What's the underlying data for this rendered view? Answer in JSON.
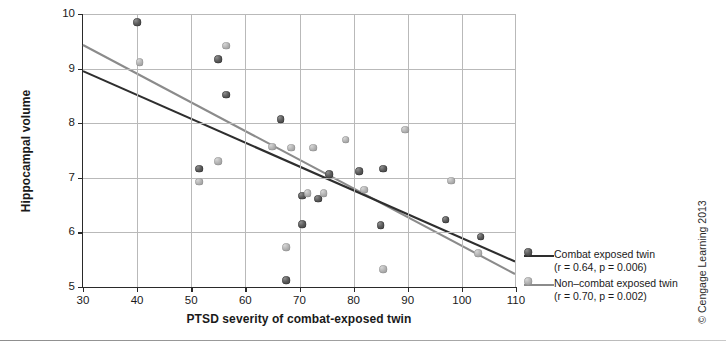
{
  "figure": {
    "copyright": "© Cengage Learning 2013"
  },
  "chart_data": {
    "type": "scatter",
    "title": "",
    "xlabel": "PTSD severity of combat-exposed twin",
    "ylabel": "Hippocampal volume",
    "xlim": [
      30,
      110
    ],
    "ylim": [
      5,
      10
    ],
    "xticks": [
      30,
      40,
      50,
      60,
      70,
      80,
      90,
      100,
      110
    ],
    "yticks": [
      5,
      6,
      7,
      8,
      9,
      10
    ],
    "grid": true,
    "legend_position": "right-outside",
    "series": [
      {
        "name": "Combat exposed twin",
        "stat_label": "(r = 0.64, p = 0.006)",
        "r": 0.64,
        "p": 0.006,
        "color": "#4a4a4a",
        "line_color": "#2e2e2e",
        "marker": "dark",
        "fit_line": {
          "x0": 30,
          "y0": 8.95,
          "x1": 110,
          "y1": 5.45
        },
        "points": [
          {
            "x": 40,
            "y": 9.85
          },
          {
            "x": 55,
            "y": 9.17
          },
          {
            "x": 56.5,
            "y": 8.52
          },
          {
            "x": 51.5,
            "y": 7.17
          },
          {
            "x": 66.5,
            "y": 8.07
          },
          {
            "x": 70.5,
            "y": 6.67
          },
          {
            "x": 70.5,
            "y": 6.15
          },
          {
            "x": 73.5,
            "y": 6.62
          },
          {
            "x": 75.5,
            "y": 7.07
          },
          {
            "x": 67.5,
            "y": 5.12
          },
          {
            "x": 81,
            "y": 7.12
          },
          {
            "x": 85.5,
            "y": 7.17
          },
          {
            "x": 85,
            "y": 6.13
          },
          {
            "x": 97,
            "y": 6.23
          },
          {
            "x": 103.5,
            "y": 5.92
          }
        ]
      },
      {
        "name": "Non–combat exposed twin",
        "stat_label": "(r = 0.70, p = 0.002)",
        "r": 0.7,
        "p": 0.002,
        "color": "#a8a8a8",
        "line_color": "#8b8b8b",
        "marker": "light",
        "fit_line": {
          "x0": 30,
          "y0": 9.43,
          "x1": 110,
          "y1": 5.22
        },
        "points": [
          {
            "x": 40.5,
            "y": 9.12
          },
          {
            "x": 56.5,
            "y": 9.42
          },
          {
            "x": 51.5,
            "y": 6.93
          },
          {
            "x": 55,
            "y": 7.3
          },
          {
            "x": 65,
            "y": 7.57
          },
          {
            "x": 68.5,
            "y": 7.55
          },
          {
            "x": 71.5,
            "y": 6.72
          },
          {
            "x": 74.5,
            "y": 6.72
          },
          {
            "x": 72.5,
            "y": 7.55
          },
          {
            "x": 67.5,
            "y": 5.73
          },
          {
            "x": 78.5,
            "y": 7.7
          },
          {
            "x": 82,
            "y": 6.78
          },
          {
            "x": 89.5,
            "y": 7.88
          },
          {
            "x": 85.5,
            "y": 5.33
          },
          {
            "x": 98,
            "y": 6.95
          },
          {
            "x": 103,
            "y": 5.62
          }
        ]
      }
    ]
  }
}
